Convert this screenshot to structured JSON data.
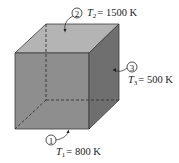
{
  "figure": {
    "colors": {
      "top_face": "#b4b4b4",
      "front_face": "#8e8e8e",
      "right_face": "#6f6f6f",
      "edge": "#3a3a3a",
      "hidden_edge": "#333333",
      "text": "#222222"
    },
    "surfaces": [
      {
        "id": "1",
        "marker": "1",
        "symbol": "T",
        "subscript": "1",
        "value": "= 800 K",
        "location": "bottom face"
      },
      {
        "id": "2",
        "marker": "2",
        "symbol": "T",
        "subscript": "2",
        "value": "= 1500 K",
        "location": "top face"
      },
      {
        "id": "3",
        "marker": "3",
        "symbol": "T",
        "subscript": "3",
        "value": "= 500 K",
        "location": "right face"
      }
    ]
  }
}
